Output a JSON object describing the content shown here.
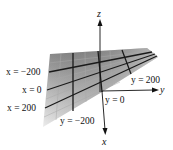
{
  "figure": {
    "type": "3d-plane-plot",
    "axes": {
      "x_label": "x",
      "y_label": "y",
      "z_label": "z"
    },
    "labels": {
      "x_minus_200": "x = −200",
      "x_0": "x = 0",
      "x_200": "x = 200",
      "y_minus_200": "y = −200",
      "y_0": "y = 0",
      "y_200": "y = 200"
    },
    "colors": {
      "plane_dark": "#8a8a8a",
      "plane_light": "#e2e2e2",
      "grid_thin": "#b0b0b0",
      "grid_thick": "#1a1a1a",
      "axis": "#111111"
    }
  }
}
